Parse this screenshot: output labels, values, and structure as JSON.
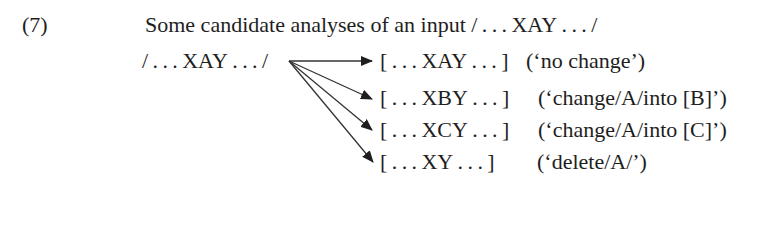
{
  "example": {
    "number": "(7)",
    "title": "Some candidate analyses of an input / . . . XAY . . . /",
    "input": "/ . . . XAY . . . /",
    "candidates": [
      {
        "form": "[ . . . XAY . . . ]",
        "gloss": "(‘no change’)"
      },
      {
        "form": "[ . . . XBY . . . ]",
        "gloss": "(‘change/A/into [B]’)"
      },
      {
        "form": "[ . . . XCY . . . ]",
        "gloss": "(‘change/A/into [C]’)"
      },
      {
        "form": "[ . . . XY . . . ]",
        "gloss": "(‘delete/A/’)"
      }
    ]
  }
}
